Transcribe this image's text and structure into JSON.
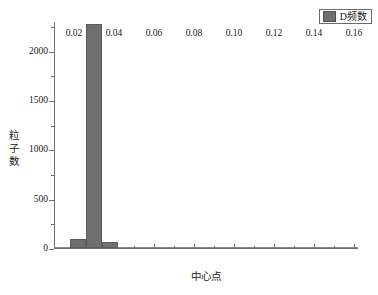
{
  "legend": {
    "entries": [
      {
        "label": "D频数",
        "color": "#706f6f",
        "swatch_name": "legend-swatch"
      }
    ],
    "position": "top-right"
  },
  "axes": {
    "y_ticks": [
      "0",
      "500",
      "1000",
      "1500",
      "2000"
    ],
    "x_ticks": [
      "0.02",
      "0.04",
      "0.06",
      "0.08",
      "0.10",
      "0.12",
      "0.14",
      "0.16"
    ],
    "ylabel": "粒子数",
    "xlabel": "中心点"
  },
  "chart_data": {
    "type": "bar",
    "title": "",
    "subtitle": "",
    "xlabel": "中心点",
    "ylabel": "粒子数",
    "xlim": [
      0.01,
      0.162
    ],
    "ylim": [
      0,
      2300
    ],
    "grid": false,
    "legend_position": "top-right",
    "bin_width": 0.008,
    "categories": [
      0.014,
      0.022,
      0.03,
      0.038,
      0.046,
      0.054,
      0.062,
      0.07,
      0.078,
      0.086,
      0.094,
      0.102,
      0.11,
      0.118,
      0.126,
      0.134,
      0.142,
      0.15,
      0.158
    ],
    "series": [
      {
        "name": "D频数",
        "color": "#706f6f",
        "values": [
          5,
          95,
          2270,
          65,
          8,
          4,
          3,
          2,
          2,
          1,
          1,
          1,
          1,
          1,
          1,
          1,
          1,
          8,
          2
        ]
      }
    ],
    "annotations": [],
    "y_tick_values": [
      0,
      500,
      1000,
      1500,
      2000
    ],
    "y_minor_tick_values": [
      250,
      750,
      1250,
      1750,
      2250
    ],
    "x_tick_values": [
      0.02,
      0.04,
      0.06,
      0.08,
      0.1,
      0.12,
      0.14,
      0.16
    ],
    "x_minor_tick_values": [
      0.03,
      0.05,
      0.07,
      0.09,
      0.11,
      0.13,
      0.15
    ]
  }
}
